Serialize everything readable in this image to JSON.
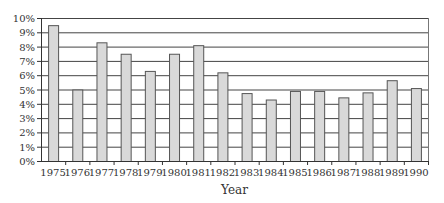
{
  "chart_data": {
    "type": "bar",
    "title": "",
    "xlabel": "Year",
    "ylabel": "",
    "categories": [
      "1975",
      "1976",
      "1977",
      "1978",
      "1979",
      "1980",
      "1981",
      "1982",
      "1983",
      "1984",
      "1985",
      "1986",
      "1987",
      "1988",
      "1989",
      "1990"
    ],
    "values": [
      9.5,
      5.0,
      8.3,
      7.5,
      6.3,
      7.5,
      8.1,
      6.2,
      4.75,
      4.3,
      4.9,
      4.9,
      4.45,
      4.8,
      5.65,
      5.1
    ],
    "value_unit": "%",
    "ylim": [
      0,
      10
    ],
    "yticks": [
      0,
      1,
      2,
      3,
      4,
      5,
      6,
      7,
      8,
      9,
      10
    ],
    "ytick_labels": [
      "0%",
      "1%",
      "2%",
      "3%",
      "4%",
      "5%",
      "6%",
      "7%",
      "8%",
      "9%",
      "10%"
    ],
    "grid": true,
    "legend": "none",
    "colors": {
      "bar_fill": "#d9d9d9",
      "bar_stroke": "#555555",
      "grid": "#444444",
      "axis": "#333333"
    }
  }
}
